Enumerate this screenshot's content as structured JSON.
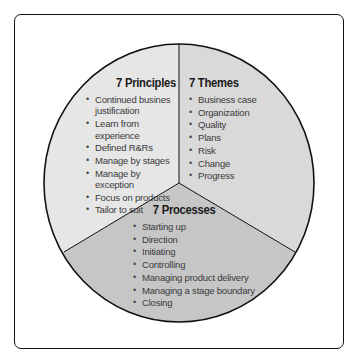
{
  "diagram": {
    "colors": {
      "principles_fill": "#e6e6e6",
      "themes_fill": "#d9d9d9",
      "processes_fill": "#c6c6c6",
      "outline": "#111111"
    },
    "segments": {
      "principles": {
        "title": "7 Principles",
        "items": [
          "Continued busines justification",
          "Learn from experience",
          "Defined R&Rs",
          "Manage by stages",
          "Manage by exception",
          "Focus on products",
          "Tailor to suit"
        ]
      },
      "themes": {
        "title": "7 Themes",
        "items": [
          "Business case",
          "Organization",
          "Quality",
          "Plans",
          "Risk",
          "Change",
          "Progress"
        ]
      },
      "processes": {
        "title": "7 Processes",
        "items": [
          "Starting up",
          "Direction",
          "Initiating",
          "Controlling",
          "Managing product delivery",
          "Managing a stage boundary",
          "Closing"
        ]
      }
    }
  }
}
